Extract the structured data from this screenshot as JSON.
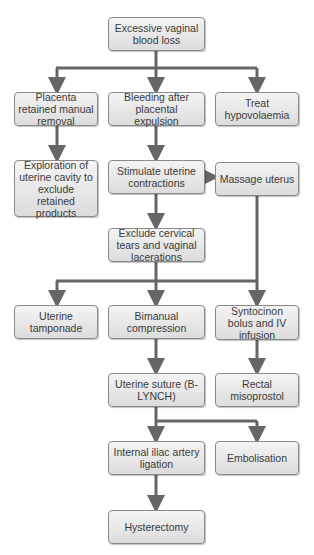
{
  "diagram": {
    "type": "flowchart",
    "colors": {
      "box_fill": "#e6e6e6",
      "box_border": "#8a8a8a",
      "connector": "#666666",
      "text": "#3a3a3a"
    },
    "nodes": {
      "n1": "Excessive vaginal blood loss",
      "n2": "Placenta retained manual removal",
      "n3": "Bleeding after placental expulsion",
      "n4": "Treat hypovolaemia",
      "n5": "Exploration of uterine cavity to exclude retained products",
      "n6": "Stimulate uterine contractions",
      "n7": "Massage uterus",
      "n8": "Exclude cervical tears and vaginal lacerations",
      "n9": "Uterine tamponade",
      "n10": "Bimanual compression",
      "n11": "Syntocinon bolus and IV infusion",
      "n12": "Uterine suture (B-LYNCH)",
      "n13": "Rectal misoprostol",
      "n14": "Internal iliac artery ligation",
      "n15": "Embolisation",
      "n16": "Hysterectomy"
    },
    "edges": [
      [
        "n1",
        "n2"
      ],
      [
        "n1",
        "n3"
      ],
      [
        "n1",
        "n4"
      ],
      [
        "n2",
        "n5"
      ],
      [
        "n3",
        "n6"
      ],
      [
        "n6",
        "n7"
      ],
      [
        "n6",
        "n8"
      ],
      [
        "n8",
        "n9"
      ],
      [
        "n8",
        "n10"
      ],
      [
        "n8",
        "n11"
      ],
      [
        "n7",
        "n11"
      ],
      [
        "n10",
        "n12"
      ],
      [
        "n11",
        "n13"
      ],
      [
        "n12",
        "n14"
      ],
      [
        "n12",
        "n15"
      ],
      [
        "n14",
        "n16"
      ]
    ]
  }
}
